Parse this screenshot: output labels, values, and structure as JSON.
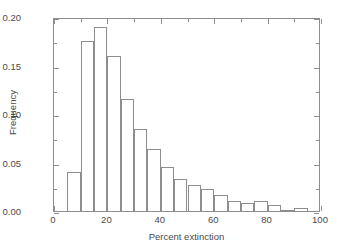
{
  "chart_data": {
    "type": "bar",
    "title": "",
    "subtitle": "",
    "xlabel": "Percent extinction",
    "ylabel": "Frequency",
    "xlim": [
      0,
      100
    ],
    "ylim": [
      0.0,
      0.2
    ],
    "grid": false,
    "legend": null,
    "bin_width": 5,
    "x_ticks": [
      0,
      20,
      40,
      60,
      80,
      100
    ],
    "x_tick_labels": [
      "0",
      "20",
      "40",
      "60",
      "80",
      "100"
    ],
    "x_minor_ticks": [
      10,
      30,
      50,
      70,
      90
    ],
    "y_ticks": [
      0.0,
      0.05,
      0.1,
      0.15,
      0.2
    ],
    "y_tick_labels": [
      "0.00",
      "0.05",
      "0.10",
      "0.15",
      "0.20"
    ],
    "y_minor_ticks": [
      0.025,
      0.075,
      0.125,
      0.175
    ],
    "bin_edges": [
      5,
      10,
      15,
      20,
      25,
      30,
      35,
      40,
      45,
      50,
      55,
      60,
      65,
      70,
      75,
      80,
      85,
      90,
      95
    ],
    "categories": [
      "5-10",
      "10-15",
      "15-20",
      "20-25",
      "25-30",
      "30-35",
      "35-40",
      "40-45",
      "45-50",
      "50-55",
      "55-60",
      "60-65",
      "65-70",
      "70-75",
      "75-80",
      "80-85",
      "85-90",
      "90-95"
    ],
    "values": [
      0.04,
      0.175,
      0.19,
      0.16,
      0.115,
      0.085,
      0.064,
      0.045,
      0.033,
      0.027,
      0.023,
      0.017,
      0.01,
      0.008,
      0.01,
      0.006,
      0.001,
      0.003
    ],
    "bar_fill_color": "#ffffff",
    "bar_edge_color": "#8d8d8d",
    "axis_color": "#8d8d8d",
    "text_color": "#4a4a4a",
    "background_color": "#ffffff"
  }
}
